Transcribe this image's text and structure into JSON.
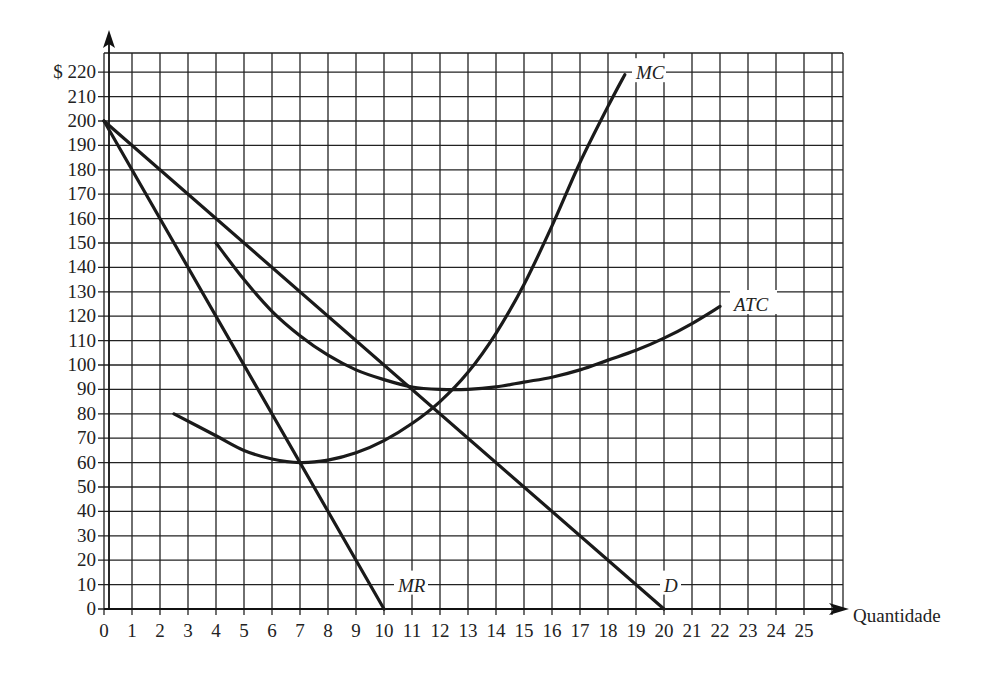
{
  "chart_data": {
    "type": "line",
    "title": "",
    "xlabel": "Quantidade",
    "ylabel": "$",
    "xlim": [
      0,
      26
    ],
    "ylim": [
      0,
      228
    ],
    "grid": true,
    "x_ticks": [
      0,
      1,
      2,
      3,
      4,
      5,
      6,
      7,
      8,
      9,
      10,
      11,
      12,
      13,
      14,
      15,
      16,
      17,
      18,
      19,
      20,
      21,
      22,
      23,
      24,
      25
    ],
    "y_ticks": [
      0,
      10,
      20,
      30,
      40,
      50,
      60,
      70,
      80,
      90,
      100,
      110,
      120,
      130,
      140,
      150,
      160,
      170,
      180,
      190,
      200,
      210,
      220
    ],
    "y_tick_prefix": "$",
    "series": [
      {
        "name": "D",
        "label_pos": [
          20,
          10
        ],
        "points": [
          [
            0,
            200
          ],
          [
            20,
            0
          ]
        ]
      },
      {
        "name": "MR",
        "label_pos": [
          10.5,
          10
        ],
        "points": [
          [
            0,
            200
          ],
          [
            10,
            0
          ]
        ]
      },
      {
        "name": "MC",
        "label_pos": [
          19,
          220
        ],
        "points": [
          [
            2.5,
            80
          ],
          [
            4,
            71
          ],
          [
            5,
            65
          ],
          [
            6,
            61.5
          ],
          [
            7,
            60
          ],
          [
            8,
            61
          ],
          [
            9,
            64
          ],
          [
            10,
            69
          ],
          [
            11,
            76
          ],
          [
            12,
            85
          ],
          [
            13,
            97
          ],
          [
            14,
            113
          ],
          [
            15,
            133
          ],
          [
            16,
            157
          ],
          [
            17,
            183
          ],
          [
            18,
            206
          ],
          [
            18.6,
            219
          ]
        ]
      },
      {
        "name": "ATC",
        "label_pos": [
          22.5,
          125
        ],
        "points": [
          [
            4,
            150
          ],
          [
            5,
            135
          ],
          [
            6,
            122
          ],
          [
            7,
            112
          ],
          [
            8,
            104
          ],
          [
            9,
            98
          ],
          [
            10,
            94
          ],
          [
            11,
            91
          ],
          [
            12,
            90
          ],
          [
            13,
            90
          ],
          [
            14,
            91
          ],
          [
            15,
            93
          ],
          [
            16,
            95
          ],
          [
            17,
            98
          ],
          [
            18,
            102
          ],
          [
            19,
            106
          ],
          [
            20,
            111
          ],
          [
            21,
            117
          ],
          [
            22,
            124
          ]
        ]
      }
    ]
  }
}
